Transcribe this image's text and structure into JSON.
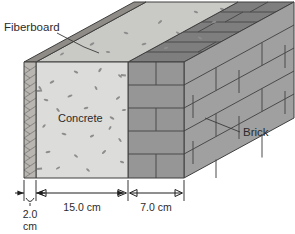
{
  "figure": {
    "background_color": "#ffffff"
  },
  "callouts": [
    {
      "id": "fiberboard",
      "label": "Fiberboard",
      "x": 4,
      "y": 22
    },
    {
      "id": "brick",
      "label": "Brick",
      "x": 243,
      "y": 135
    }
  ],
  "material_labels": [
    {
      "id": "concrete",
      "label": "Concrete",
      "x": 58,
      "y": 122
    }
  ],
  "dimensions": [
    {
      "id": "fiberboard-thickness",
      "value": "2.0",
      "unit": "cm",
      "line1": "2.0",
      "line2": "cm",
      "label": "2.0 cm"
    },
    {
      "id": "concrete-thickness",
      "value": "15.0",
      "unit": "cm",
      "label": "15.0 cm"
    },
    {
      "id": "brick-thickness",
      "value": "7.0",
      "unit": "cm",
      "label": "7.0 cm"
    }
  ],
  "colors": {
    "fiberboard_face": "#b9b6b1",
    "fiberboard_top": "#8f8c87",
    "concrete_face": "#dcdcda",
    "concrete_top": "#c9c9c6",
    "brick_face": "#969696",
    "brick_side": "#a0a0a0",
    "brick_top": "#7e7e7e",
    "outline": "#3f3f3f",
    "text": "#2b2b2b"
  }
}
